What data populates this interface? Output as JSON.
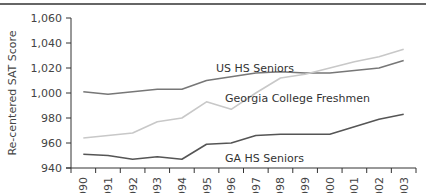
{
  "chart_data": {
    "type": "line",
    "title": "",
    "xlabel": "",
    "ylabel": "Re-centered SAT Score",
    "ylim": [
      940,
      1060
    ],
    "yticks": [
      940,
      960,
      980,
      1000,
      1020,
      1040,
      1060
    ],
    "ytick_labels": [
      "940",
      "960",
      "980",
      "1,000",
      "1,020",
      "1,040",
      "1,060"
    ],
    "grid": false,
    "legend_position": "inline labels",
    "categories": [
      "1990",
      "1991",
      "1992",
      "1993",
      "1994",
      "1995",
      "1996",
      "1997",
      "1998",
      "1999",
      "2000",
      "2001",
      "2002",
      "2003"
    ],
    "series": [
      {
        "name": "US HS Seniors",
        "color": "#777777",
        "values": [
          1001,
          999,
          1001,
          1003,
          1003,
          1010,
          1013,
          1016,
          1017,
          1016,
          1016,
          1018,
          1020,
          1026
        ],
        "label_pos": {
          "x": 216,
          "y": 72
        }
      },
      {
        "name": "Georgia College Freshmen",
        "color": "#c8c8c8",
        "values": [
          964,
          966,
          968,
          977,
          980,
          993,
          987,
          1000,
          1012,
          1015,
          1020,
          1025,
          1029,
          1035
        ],
        "label_pos": {
          "x": 225,
          "y": 102
        }
      },
      {
        "name": "GA HS Seniors",
        "color": "#555555",
        "values": [
          951,
          950,
          947,
          949,
          947,
          959,
          960,
          966,
          967,
          967,
          967,
          973,
          979,
          983
        ],
        "label_pos": {
          "x": 225,
          "y": 162
        }
      }
    ]
  }
}
